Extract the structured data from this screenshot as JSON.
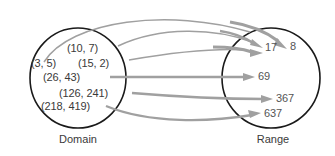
{
  "figure": {
    "type": "mapping-diagram",
    "sets": {
      "domain": {
        "label": "Domain",
        "elements": [
          {
            "id": "d1",
            "text": "(3, 5)"
          },
          {
            "id": "d2",
            "text": "(10, 7)"
          },
          {
            "id": "d3",
            "text": "(15, 2)"
          },
          {
            "id": "d4",
            "text": "(26, 43)"
          },
          {
            "id": "d5",
            "text": "(126, 241)"
          },
          {
            "id": "d6",
            "text": "(218, 419)"
          }
        ]
      },
      "range": {
        "label": "Range",
        "elements": [
          {
            "id": "r1",
            "text": "8"
          },
          {
            "id": "r2",
            "text": "17"
          },
          {
            "id": "r3",
            "text": "69"
          },
          {
            "id": "r4",
            "text": "367"
          },
          {
            "id": "r5",
            "text": "637"
          }
        ]
      }
    },
    "mappings": [
      {
        "from": "(3, 5)",
        "to": "8"
      },
      {
        "from": "(10, 7)",
        "to": "17"
      },
      {
        "from": "(15, 2)",
        "to": "17"
      },
      {
        "from": "(26, 43)",
        "to": "69"
      },
      {
        "from": "(126, 241)",
        "to": "367"
      },
      {
        "from": "(218, 419)",
        "to": "637"
      }
    ]
  },
  "colors": {
    "oval_stroke": "#1a1a1a",
    "arrow": "#a0a0a0",
    "text": "#3a3a3a",
    "background": "#ffffff"
  }
}
